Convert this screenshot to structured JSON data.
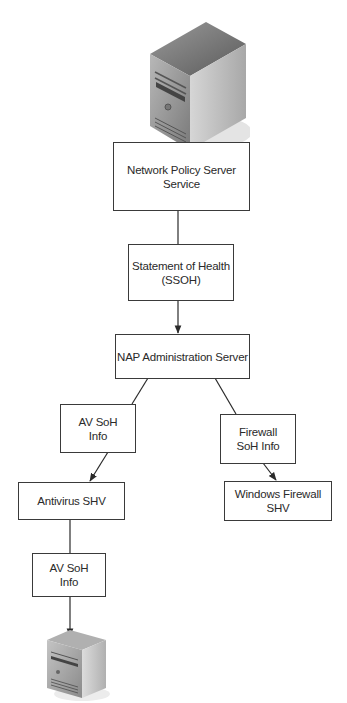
{
  "diagram": {
    "nodes": [
      {
        "id": "nps",
        "label": "Network Policy Server\nService"
      },
      {
        "id": "ssoh",
        "label": "Statement of Health\n(SSOH)"
      },
      {
        "id": "nap",
        "label": "NAP Administration Server"
      },
      {
        "id": "av_soh_1",
        "label": "AV SoH\nInfo"
      },
      {
        "id": "fw_soh",
        "label": "Firewall\nSoH Info"
      },
      {
        "id": "av_shv",
        "label": "Antivirus SHV"
      },
      {
        "id": "win_fw_shv",
        "label": "Windows Firewall\nSHV"
      },
      {
        "id": "av_soh_2",
        "label": "AV SoH\nInfo"
      }
    ],
    "icons": [
      {
        "id": "top_server",
        "type": "server-tower-icon"
      },
      {
        "id": "bottom_server",
        "type": "server-tower-icon"
      }
    ],
    "edges": [
      {
        "from": "top_server",
        "to": "nps",
        "arrow": false
      },
      {
        "from": "nps",
        "to": "ssoh",
        "arrow": false
      },
      {
        "from": "ssoh",
        "to": "nap",
        "arrow": true
      },
      {
        "from": "nap",
        "to": "av_soh_1",
        "arrow": false
      },
      {
        "from": "nap",
        "to": "fw_soh",
        "arrow": false
      },
      {
        "from": "av_soh_1",
        "to": "av_shv",
        "arrow": true
      },
      {
        "from": "fw_soh",
        "to": "win_fw_shv",
        "arrow": true
      },
      {
        "from": "av_shv",
        "to": "av_soh_2",
        "arrow": false
      },
      {
        "from": "av_soh_2",
        "to": "bottom_server",
        "arrow": true
      }
    ]
  }
}
